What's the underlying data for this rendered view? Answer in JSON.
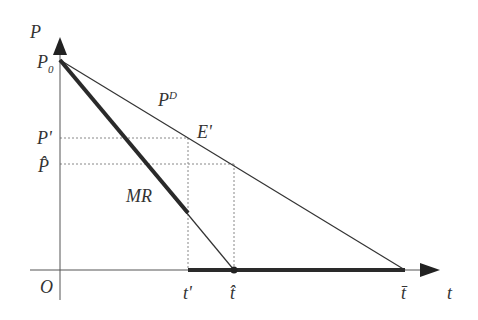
{
  "diagram": {
    "type": "economics-demand-mr",
    "axes": {
      "y_label": "P",
      "x_label": "t",
      "origin_label": "O"
    },
    "labels": {
      "p0": {
        "main": "P",
        "sub": "0"
      },
      "p_prime": "P'",
      "p_hat": "P̂",
      "demand": {
        "main": "P",
        "sup": "D"
      },
      "equilibrium": "E'",
      "mr": "MR",
      "t_prime": "t'",
      "t_hat": "t̂",
      "t_bar": "t̄"
    },
    "colors": {
      "line": "#333333",
      "axis": "#555555",
      "dashed": "#888888",
      "thick": "#2a2a2a"
    },
    "points": {
      "origin": [
        60,
        270
      ],
      "P0": [
        60,
        60
      ],
      "E_prime": [
        188,
        138
      ],
      "P_hat_on_demand": [
        234,
        164
      ],
      "MR_thick_end": [
        188,
        213
      ],
      "t_prime": [
        188,
        270
      ],
      "t_hat": [
        234,
        270
      ],
      "t_bar": [
        405,
        270
      ]
    }
  }
}
